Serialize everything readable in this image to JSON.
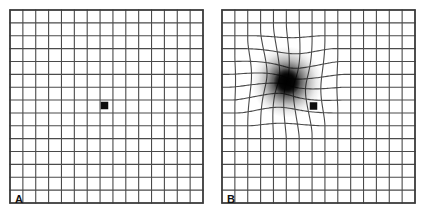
{
  "figure": {
    "background_color": "#ffffff",
    "width": 427,
    "height": 218
  },
  "chart_data": {
    "type": "diagram",
    "grid": {
      "columns": 15,
      "rows": 15,
      "cell_size_px": 12.87,
      "line_color": "#4a4a4a",
      "line_width_px": 1.1,
      "border_color": "#3a3a3a",
      "border_width_px": 1.6
    },
    "panels": [
      {
        "id": "A",
        "label": "A",
        "label_position": "bottom-left-inside",
        "description": "Normal undistorted Amsler grid with central fixation square",
        "origin_x": 10,
        "origin_y": 10,
        "width": 193,
        "height": 193,
        "distorted": false,
        "fixation_square": {
          "name": "fixation-square",
          "center_x": 104.5,
          "center_y": 105.5,
          "size_px": 7.5,
          "color": "#0d0d0d"
        }
      },
      {
        "id": "B",
        "label": "B",
        "label_position": "bottom-left-inside",
        "description": "Amsler grid showing metamorphopsia: lines bend and converge toward a dark central scotoma",
        "origin_x": 222,
        "origin_y": 10,
        "width": 193,
        "height": 193,
        "distorted": true,
        "distortion": {
          "name": "central-scotoma",
          "center_x": 287,
          "center_y": 82,
          "pull_radius_px": 58,
          "pull_strength": 0.62,
          "blur_radius_px": 17,
          "blur_color": "#000000"
        },
        "fixation_square": {
          "name": "fixation-square",
          "center_x": 313.5,
          "center_y": 106,
          "size_px": 7.5,
          "color": "#0d0d0d"
        }
      }
    ],
    "xlabel": "",
    "ylabel": "",
    "legend": []
  }
}
